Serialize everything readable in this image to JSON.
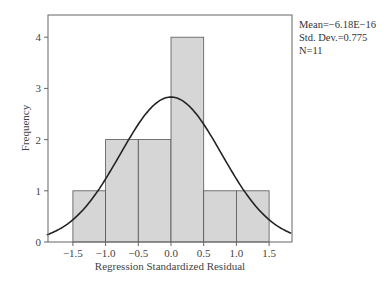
{
  "chart_data": {
    "type": "bar",
    "subtype": "histogram",
    "title": "",
    "xlabel": "Regression Standardized Residual",
    "ylabel": "Frequency",
    "bins": [
      {
        "from": -1.5,
        "to": -1.0,
        "count": 1
      },
      {
        "from": -1.0,
        "to": -0.5,
        "count": 2
      },
      {
        "from": -0.5,
        "to": 0.0,
        "count": 2
      },
      {
        "from": 0.0,
        "to": 0.5,
        "count": 4
      },
      {
        "from": 0.5,
        "to": 1.0,
        "count": 1
      },
      {
        "from": 1.0,
        "to": 1.5,
        "count": 1
      }
    ],
    "categories": [
      "-1.5 to -1.0",
      "-1.0 to -0.5",
      "-0.5 to 0.0",
      "0.0 to 0.5",
      "0.5 to 1.0",
      "1.0 to 1.5"
    ],
    "values": [
      1,
      2,
      2,
      4,
      1,
      1
    ],
    "x_ticks": [
      "-1.5",
      "-1.0",
      "-0.5",
      "0.0",
      "0.5",
      "1.0",
      "1.5"
    ],
    "y_ticks": [
      "0",
      "1",
      "2",
      "3",
      "4"
    ],
    "xlim": [
      -1.9,
      1.85
    ],
    "ylim": [
      0,
      4.4
    ],
    "grid": false,
    "overlay": {
      "type": "normal-curve",
      "mean": 0,
      "std": 0.775,
      "n": 11,
      "bin_width": 0.5,
      "peak": 2.83
    },
    "colors": {
      "bar_fill": "#d6d6d6",
      "bar_edge": "#555555",
      "curve": "#222222",
      "frame": "#666666"
    }
  },
  "stats": {
    "mean": "Mean=−6.18E−16",
    "std": "Std. Dev.=0.775",
    "n": "N=11"
  }
}
